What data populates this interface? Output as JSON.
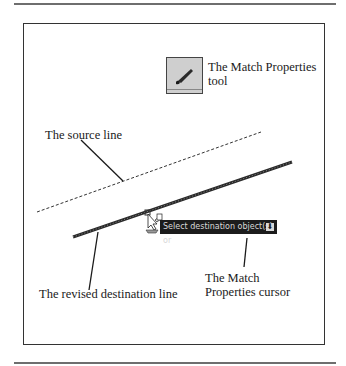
{
  "figure": {
    "labels": {
      "tool": "The Match Properties\ntool",
      "tool_line1": "The Match Properties",
      "tool_line2": "tool",
      "source_line": "The source line",
      "destination_line": "The revised destination line",
      "cursor_line1": "The Match",
      "cursor_line2": "Properties cursor"
    },
    "tooltip": {
      "text": "Select destination object(s) or",
      "button_icon": "down-arrow-icon"
    },
    "icons": {
      "tool": "paintbrush-icon",
      "cursor": "match-properties-cursor-icon"
    },
    "colors": {
      "frame": "#333333",
      "tooltip_bg": "#1c1c1c",
      "tooltip_text": "#d8d8d8",
      "icon_bg": "#cfcfcf"
    }
  }
}
